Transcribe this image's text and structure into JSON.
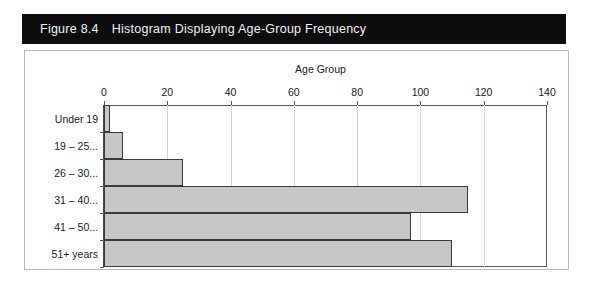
{
  "figure": {
    "number": "Figure 8.4",
    "caption": "Histogram Displaying Age-Group Frequency"
  },
  "colors": {
    "banner_bg": "#0d0d0d",
    "banner_text": "#f2f2f2",
    "bar_fill": "#c6c6c6",
    "bar_border": "#3a3a3a",
    "gridline": "#d2d2d2",
    "panel_border": "#b9b9b9"
  },
  "chart_data": {
    "type": "bar",
    "orientation": "horizontal",
    "title": "",
    "xlabel": "Age Group",
    "ylabel": "",
    "xlim": [
      0,
      140
    ],
    "xticks": [
      0,
      20,
      40,
      60,
      80,
      100,
      120,
      140
    ],
    "xtick_labels": [
      "0",
      "20",
      "40",
      "60",
      "80",
      "100",
      "120",
      "140"
    ],
    "grid": true,
    "axis_position": "top",
    "legend": "none",
    "categories": [
      "Under 19",
      "19 – 25...",
      "26 – 30...",
      "31 – 40...",
      "41 – 50...",
      "51+ years"
    ],
    "values": [
      2,
      6,
      25,
      115,
      97,
      110
    ],
    "bar_gap": 0
  }
}
